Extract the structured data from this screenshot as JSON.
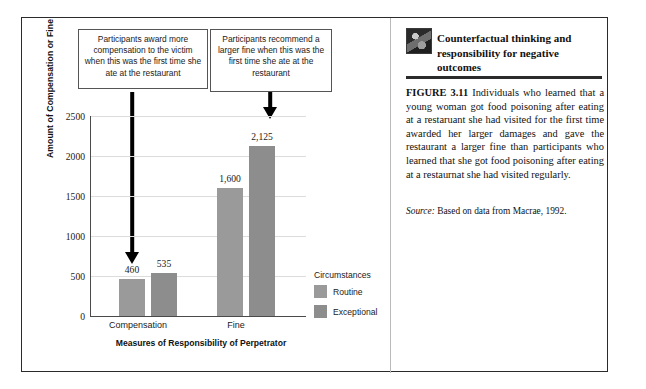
{
  "figure": {
    "callouts": [
      {
        "id": "compensation",
        "text": "Participants award more compensation to the victim when this was the first time she ate at the restaurant"
      },
      {
        "id": "fine",
        "text": "Participants recommend a larger fine when this was the first time she ate at the restaurant"
      }
    ]
  },
  "chart_data": {
    "type": "bar",
    "title": "",
    "xlabel": "Measures of Responsibility of Perpetrator",
    "ylabel": "Amount of Compensation or Fine",
    "categories": [
      "Compensation",
      "Fine"
    ],
    "ylim": [
      0,
      2500
    ],
    "yticks": [
      0,
      500,
      1000,
      1500,
      2000,
      2500
    ],
    "ytick_labels": [
      "0",
      "500",
      "1000",
      "1500",
      "2000",
      "2500"
    ],
    "grid": true,
    "legend_position": "right",
    "legend_title": "Circumstances",
    "series": [
      {
        "name": "Routine",
        "color": "#9a9a9a",
        "values": [
          460,
          1600
        ],
        "value_labels": [
          "460",
          "1,600"
        ]
      },
      {
        "name": "Exceptional",
        "color": "#8d8d8d",
        "values": [
          535,
          2125
        ],
        "value_labels": [
          "535",
          "2,125"
        ]
      }
    ],
    "annotations": [
      {
        "name": "arrow-to-exceptional-compensation",
        "target": "Exceptional / Compensation"
      },
      {
        "name": "arrow-to-exceptional-fine",
        "target": "Exceptional / Fine"
      }
    ]
  },
  "caption": {
    "heading": "Counterfactual thinking and responsibility for negative outcomes",
    "figure_number": "FIGURE 3.11",
    "body": "Individuals who learned that a young woman got food poisoning after eating at a restaruant she had visited for the first time awarded her larger damages and gave the restaurant a larger fine than participants who learned that she got food poisoning after eating at a restaurnat she had visited regularly.",
    "source_label": "Source:",
    "source_text": "Based on data from Macrae, 1992."
  }
}
